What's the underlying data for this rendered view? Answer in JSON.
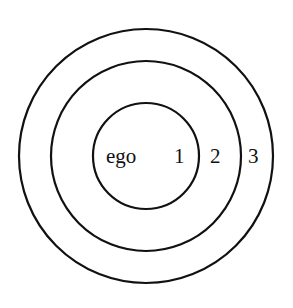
{
  "diagram": {
    "type": "concentric-circles",
    "colors": {
      "background": "#ffffff",
      "stroke": "#111111"
    },
    "center": {
      "x": 146,
      "y": 156
    },
    "circles": [
      {
        "name": "inner",
        "r": 53
      },
      {
        "name": "middle",
        "r": 95
      },
      {
        "name": "outer",
        "r": 128
      }
    ],
    "labels": {
      "ego": "ego",
      "ring1": "1",
      "ring2": "2",
      "ring3": "3"
    }
  }
}
